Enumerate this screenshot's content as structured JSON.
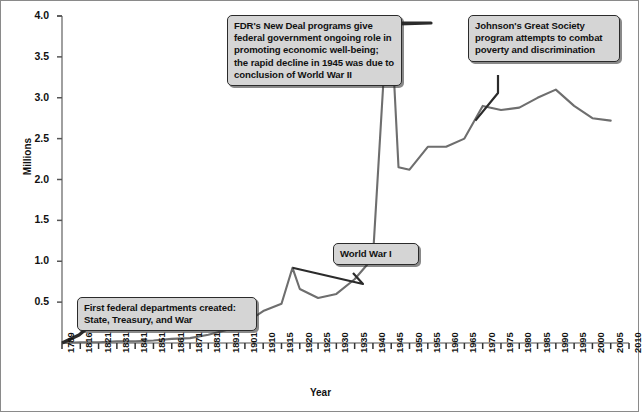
{
  "figure": {
    "background": "#ffffff",
    "border_color": "#8a8a8a",
    "line_color": "#6e6e6e",
    "callout_fill": "#d5d5d5",
    "callout_border": "#2b2b2b"
  },
  "annotations": {
    "fdr": "FDR's New Deal programs give federal government ongoing role in promoting economic well-being; the rapid decline in 1945 was due to conclusion of World War II",
    "johnson": "Johnson's Great Society program attempts to combat poverty and discrimination",
    "ww1": "World War I",
    "departments": "First federal departments created: State, Treasury, and War"
  },
  "chart_data": {
    "type": "line",
    "title": "",
    "xlabel": "Year",
    "ylabel": "Millions",
    "ylim": [
      0,
      4.0
    ],
    "yticks": [
      0.5,
      1.0,
      1.5,
      2.0,
      2.5,
      3.0,
      3.5,
      4.0
    ],
    "ytick_labels": [
      "0.5",
      "1.0",
      "1.5",
      "2.0",
      "2.5",
      "3.0",
      "3.5",
      "4.0"
    ],
    "xticks": [
      1789,
      1816,
      1821,
      1831,
      1841,
      1851,
      1861,
      1871,
      1881,
      1891,
      1901,
      1910,
      1915,
      1920,
      1925,
      1930,
      1935,
      1940,
      1945,
      1950,
      1955,
      1960,
      1965,
      1970,
      1975,
      1980,
      1985,
      1990,
      1995,
      2000,
      2005,
      2010
    ],
    "xtick_labels": [
      "1789",
      "1816",
      "1821",
      "1831",
      "1841",
      "1851",
      "1861",
      "1871",
      "1881",
      "1891",
      "1901",
      "1910",
      "1915",
      "1920",
      "1925",
      "1930",
      "1935",
      "1940",
      "1945",
      "1950",
      "1955",
      "1960",
      "1965",
      "1970",
      "1975",
      "1980",
      "1985",
      "1990",
      "1995",
      "2000",
      "2005",
      "2010"
    ],
    "grid": false,
    "legend": null,
    "series": [
      {
        "name": "Federal civilian employment",
        "x": [
          1789,
          1816,
          1821,
          1831,
          1841,
          1851,
          1861,
          1871,
          1881,
          1891,
          1901,
          1910,
          1915,
          1918,
          1920,
          1925,
          1930,
          1935,
          1940,
          1943,
          1945,
          1947,
          1950,
          1955,
          1960,
          1965,
          1970,
          1975,
          1980,
          1985,
          1990,
          1995,
          2000,
          2005
        ],
        "values": [
          0.0,
          0.01,
          0.01,
          0.02,
          0.02,
          0.03,
          0.05,
          0.06,
          0.1,
          0.16,
          0.24,
          0.39,
          0.48,
          0.92,
          0.66,
          0.55,
          0.6,
          0.78,
          1.04,
          3.3,
          3.9,
          2.15,
          2.12,
          2.4,
          2.4,
          2.5,
          2.9,
          2.85,
          2.88,
          3.0,
          3.1,
          2.9,
          2.75,
          2.72
        ]
      }
    ]
  }
}
